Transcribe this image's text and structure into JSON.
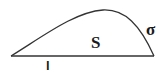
{
  "diagram": {
    "type": "region bounded by a line segment and a curve",
    "labels": {
      "region": "S",
      "curve": "σ",
      "segment": "l"
    },
    "colors": {
      "stroke": "#333333",
      "text": "#1a1a1a",
      "background": "#ffffff"
    }
  }
}
